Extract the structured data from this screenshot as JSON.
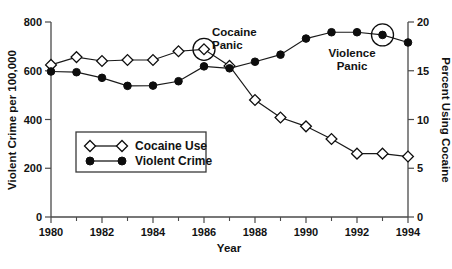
{
  "chart_data": {
    "type": "line",
    "title": "",
    "xlabel": "Year",
    "ylabel": "Violent Crime per 100,000",
    "y2label": "Percent Using Cocaine",
    "x": [
      1980,
      1981,
      1982,
      1983,
      1984,
      1985,
      1986,
      1987,
      1988,
      1989,
      1990,
      1991,
      1992,
      1993,
      1994
    ],
    "xlim": [
      1980,
      1994
    ],
    "ylim": [
      0,
      800
    ],
    "y2lim": [
      0,
      20
    ],
    "grid": false,
    "legend_position": "center-left",
    "xticks": [
      1980,
      1982,
      1984,
      1986,
      1988,
      1990,
      1992,
      1994
    ],
    "xticks_minor": [
      1981,
      1983,
      1985,
      1987,
      1989,
      1991,
      1993
    ],
    "yticks": [
      0,
      200,
      400,
      600,
      800
    ],
    "y2ticks": [
      0,
      5,
      10,
      15,
      20
    ],
    "series": [
      {
        "name": "Cocaine Use",
        "axis": "right",
        "marker": "open-diamond",
        "values": [
          15.6,
          16.4,
          16.0,
          16.1,
          16.1,
          17.0,
          17.2,
          15.5,
          12.0,
          10.2,
          9.3,
          8.0,
          6.5,
          6.5,
          6.2
        ]
      },
      {
        "name": "Violent Crime",
        "axis": "left",
        "marker": "filled-circle",
        "values": [
          597,
          594,
          571,
          538,
          539,
          557,
          618,
          610,
          637,
          666,
          732,
          758,
          758,
          747,
          716
        ]
      }
    ],
    "annotations": [
      {
        "label": "Cocaine\nPanic",
        "line1": "Cocaine",
        "line2": "Panic",
        "target_x": 1986,
        "target_series": "Cocaine Use",
        "marker": "circle-highlight"
      },
      {
        "label": "Violence\nPanic",
        "line1": "Violence",
        "line2": "Panic",
        "target_x": 1993,
        "target_series": "Violent Crime",
        "marker": "circle-highlight"
      }
    ]
  },
  "axes": {
    "y_left_title": "Violent Crime per 100,000",
    "y_right_title": "Percent Using Cocaine",
    "x_title": "Year",
    "y_left_ticks": [
      "0",
      "200",
      "400",
      "600",
      "800"
    ],
    "y_right_ticks": [
      "0",
      "5",
      "10",
      "15",
      "20"
    ],
    "x_ticks": [
      "1980",
      "1982",
      "1984",
      "1986",
      "1988",
      "1990",
      "1992",
      "1994"
    ]
  },
  "legend": {
    "entries": [
      {
        "label": "Cocaine Use",
        "marker": "open-diamond"
      },
      {
        "label": "Violent Crime",
        "marker": "filled-circle"
      }
    ]
  },
  "annotations": {
    "cocaine_panic_line1": "Cocaine",
    "cocaine_panic_line2": "Panic",
    "violence_panic_line1": "Violence",
    "violence_panic_line2": "Panic"
  },
  "colors": {
    "line": "#1a1a1a",
    "axis": "#4a4a4a",
    "text": "#121212",
    "background": "#ffffff"
  }
}
